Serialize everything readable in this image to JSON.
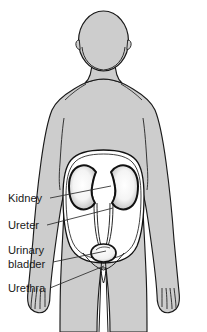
{
  "figure": {
    "background_color": "#ffffff"
  },
  "colors": {
    "body_fill": "#cdcdcd",
    "body_outline": "#1a1a1a",
    "cavity_fill": "#ffffff",
    "organ_outline": "#111111",
    "kidney_fill": "#f2f2f2",
    "bladder_fill": "#f5f5f5",
    "leader_line": "#2a2a2a",
    "label_text": "#1a1a1a"
  },
  "labels": [
    {
      "id": "kidney",
      "text": "Kidney",
      "lines": [
        "Kidney"
      ],
      "x": 8,
      "y": 202,
      "leader_from": {
        "x": 50,
        "y": 198
      },
      "leader_to": {
        "x": 111,
        "y": 186
      }
    },
    {
      "id": "ureter",
      "text": "Ureter",
      "lines": [
        "Ureter"
      ],
      "x": 8,
      "y": 229,
      "leader_from": {
        "x": 47,
        "y": 225
      },
      "leader_to": {
        "x": 113,
        "y": 208
      }
    },
    {
      "id": "urinary-bladder",
      "text": "Urinary bladder",
      "lines": [
        "Urinary",
        "bladder"
      ],
      "x": 8,
      "y": 254,
      "y2": 268,
      "leader_from": {
        "x": 53,
        "y": 262
      },
      "leader_to": {
        "x": 106,
        "y": 251
      }
    },
    {
      "id": "urethra",
      "text": "Urethra",
      "lines": [
        "Urethra"
      ],
      "x": 8,
      "y": 292,
      "leader_from": {
        "x": 50,
        "y": 288
      },
      "leader_to": {
        "x": 104,
        "y": 266
      }
    }
  ],
  "anatomy": {
    "head": "oval head with ears and neck",
    "torso": "shoulders, arms at sides, hands with fingers",
    "legs": "two legs separated by vertical gap",
    "cavity": "white rounded abdominal cavity window",
    "kidney_left": "bean-shaped kidney, viewer left",
    "kidney_right": "bean-shaped kidney, viewer right",
    "ureter_left": "thin tube from left kidney to bladder",
    "ureter_right": "thin tube from right kidney to bladder",
    "bladder": "small rounded bladder at cavity base",
    "urethra": "short tube descending from bladder"
  }
}
